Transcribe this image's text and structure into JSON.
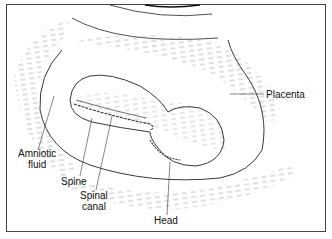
{
  "diagram": {
    "labels": {
      "placenta": "Placenta",
      "amniotic_fluid_line1": "Amniotic",
      "amniotic_fluid_line2": "fluid",
      "spine": "Spine",
      "spinal_canal_line1": "Spinal",
      "spinal_canal_line2": "canal",
      "head": "Head"
    },
    "colors": {
      "line": "#222222",
      "hatch": "#9a9a9a",
      "background": "#ffffff"
    }
  }
}
